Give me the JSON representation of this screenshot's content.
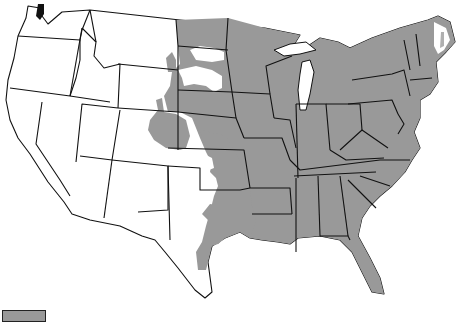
{
  "map": {
    "type": "choropleth-range-map",
    "region": "Contiguous United States",
    "projection": "Albers-like",
    "colors": {
      "range_fill": "#999999",
      "non_range_fill": "#ffffff",
      "border": "#111111"
    },
    "range_description": "Gray shaded area covers eastern and central states, extending west into eastern Dakotas, Nebraska, Kansas, Oklahoma, eastern Colorado patch and central/east Texas; northern Maine largely unshaded",
    "fully_shaded_states": [
      "MN",
      "WI",
      "MI",
      "IA",
      "MO",
      "IL",
      "IN",
      "OH",
      "KY",
      "TN",
      "AR",
      "LA",
      "MS",
      "AL",
      "GA",
      "FL",
      "SC",
      "NC",
      "VA",
      "WV",
      "PA",
      "NY",
      "VT",
      "NH",
      "MA",
      "CT",
      "RI",
      "NJ",
      "DE",
      "MD"
    ],
    "partially_shaded_states": [
      "ND",
      "SD",
      "NE",
      "KS",
      "OK",
      "TX",
      "CO",
      "ME",
      "WY",
      "MT"
    ],
    "unshaded_states": [
      "WA",
      "OR",
      "CA",
      "NV",
      "ID",
      "UT",
      "AZ",
      "NM"
    ]
  },
  "legend": {
    "items": [
      {
        "swatch_color": "#999999",
        "label": ""
      }
    ]
  }
}
